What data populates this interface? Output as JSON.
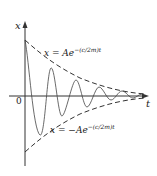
{
  "diagram": {
    "type": "damped-oscillation-graph",
    "axes": {
      "vertical_label": "x",
      "horizontal_label": "t",
      "origin_label": "0"
    },
    "envelopes": {
      "upper": {
        "lhs": "x = Ae",
        "exponent": "−(c/2m)t"
      },
      "lower": {
        "lhs": "x = −Ae",
        "exponent": "−(c/2m)t"
      }
    },
    "colors": {
      "stroke": "#333333",
      "background": "#ffffff"
    }
  }
}
